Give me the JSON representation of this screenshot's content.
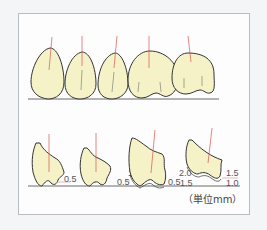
{
  "diagram": {
    "colors": {
      "tooth_fill": "#f6f2c8",
      "outline": "#333333",
      "axis_line": "#d9534f",
      "measure_line": "#c77",
      "frame_border": "#b9bcc0"
    },
    "top_row": {
      "tooth_count": 5
    },
    "bottom_row": {
      "teeth": [
        {
          "labels": [
            "0.5"
          ]
        },
        {
          "labels": [
            "1.0",
            "0.5"
          ]
        },
        {
          "labels": [
            "0.5"
          ]
        },
        {
          "labels": [
            "2.0",
            "1.5",
            "1.5",
            "1.0"
          ]
        }
      ],
      "measurements": {
        "t1_right": "0.5",
        "t2_left_upper": "1.0",
        "t2_left_lower": "0.5",
        "t3_right": "0.5",
        "t4_left_upper": "2.0",
        "t4_left_lower": "1.5",
        "t4_right_upper": "1.5",
        "t4_right_lower": "1.0"
      }
    },
    "unit_label": "（単位mm）"
  }
}
